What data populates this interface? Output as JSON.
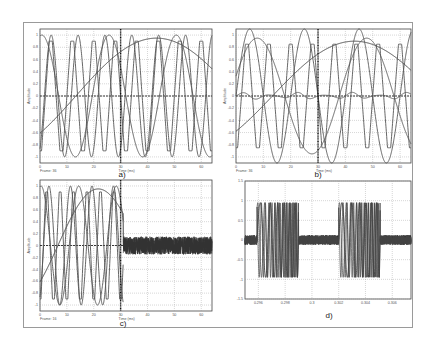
{
  "chart_data": [
    {
      "id": "a",
      "type": "line",
      "caption": "a)",
      "xlabel": "Time (ms)",
      "ylabel": "Amplitude",
      "frame_label": "Frame: 36",
      "xlim": [
        0,
        64
      ],
      "ylim": [
        -1.1,
        1.1
      ],
      "xticks": [
        "0",
        "10",
        "20",
        "30",
        "40",
        "50",
        "60"
      ],
      "yticks": [
        "1",
        "0.8",
        "0.6",
        "0.4",
        "0.2",
        "0",
        "-0.2",
        "-0.4",
        "-0.6",
        "-0.8",
        "-1"
      ],
      "cursor_x": 30,
      "grid": true,
      "series": [
        {
          "name": "slow sine",
          "kind": "sine",
          "amp": 0.95,
          "period_ms": 120,
          "phase_deg": -40
        },
        {
          "name": "medium sine",
          "kind": "sine",
          "amp": 1.0,
          "period_ms": 25,
          "phase_deg": 80
        },
        {
          "name": "fast sine",
          "kind": "sine",
          "amp": 1.0,
          "period_ms": 10,
          "phase_deg": -60
        },
        {
          "name": "triangle",
          "kind": "triangle",
          "amp": 0.9,
          "period_ms": 8,
          "phase_deg": 0
        }
      ]
    },
    {
      "id": "b",
      "type": "line",
      "caption": "b)",
      "xlabel": "Time (ms)",
      "ylabel": "Amplitude",
      "frame_label": "Frame: 36",
      "xlim": [
        0,
        64
      ],
      "ylim": [
        -1.1,
        1.1
      ],
      "xticks": [
        "0",
        "10",
        "20",
        "30",
        "40",
        "50",
        "60"
      ],
      "yticks": [
        "1",
        "0.8",
        "0.6",
        "0.4",
        "0.2",
        "0",
        "-0.2",
        "-0.4",
        "-0.6",
        "-0.8",
        "-1"
      ],
      "cursor_x": 30,
      "grid": true,
      "series": [
        {
          "name": "slow sine",
          "kind": "sine",
          "amp": 0.9,
          "period_ms": 120,
          "phase_deg": -40
        },
        {
          "name": "medium sine",
          "kind": "sine",
          "amp": 0.95,
          "period_ms": 40,
          "phase_deg": 20
        },
        {
          "name": "fast sine",
          "kind": "sine",
          "amp": 1.1,
          "period_ms": 20,
          "phase_deg": 0
        },
        {
          "name": "triangle",
          "kind": "triangle",
          "amp": 0.85,
          "period_ms": 8,
          "phase_deg": 0
        },
        {
          "name": "residual",
          "kind": "ripple",
          "amp": 0.06,
          "period_ms": 10,
          "phase_deg": 0
        }
      ]
    },
    {
      "id": "c",
      "type": "line",
      "caption": "c)",
      "xlabel": "Time (ms)",
      "ylabel": "Amplitude",
      "frame_label": "Frame: 16",
      "xlim": [
        0,
        64
      ],
      "ylim": [
        -1.1,
        1.1
      ],
      "xticks": [
        "0",
        "10",
        "20",
        "30",
        "40",
        "50",
        "60"
      ],
      "yticks": [
        "1",
        "0.8",
        "0.6",
        "0.4",
        "0.2",
        "0",
        "-0.2",
        "-0.4",
        "-0.6",
        "-0.8",
        "-1"
      ],
      "cursor_x": 30,
      "grid": true,
      "signal_end_ms": 31,
      "noise_amp_after": 0.15,
      "series": [
        {
          "name": "slow sine",
          "kind": "sine",
          "amp": 0.95,
          "period_ms": 60,
          "phase_deg": -40
        },
        {
          "name": "medium sine",
          "kind": "sine",
          "amp": 1.0,
          "period_ms": 14,
          "phase_deg": 80
        },
        {
          "name": "fast sine",
          "kind": "sine",
          "amp": 1.0,
          "period_ms": 8,
          "phase_deg": -60
        },
        {
          "name": "triangle",
          "kind": "triangle",
          "amp": 0.9,
          "period_ms": 5,
          "phase_deg": 0
        }
      ]
    },
    {
      "id": "d",
      "type": "line",
      "caption": "d)",
      "xlabel": "",
      "ylabel": "",
      "xlim": [
        0.295,
        0.3074
      ],
      "ylim": [
        -1.5,
        1.5
      ],
      "xticks": [
        "0.296",
        "0.298",
        "0.3",
        "0.302",
        "0.304",
        "0.306"
      ],
      "xtick_values": [
        0.296,
        0.298,
        0.3,
        0.302,
        0.304,
        0.306
      ],
      "yticks": [
        "1.5",
        "1",
        "0.5",
        "0",
        "-0.5",
        "-1",
        "-1.5"
      ],
      "grid": true,
      "bursts": [
        [
          0.2959,
          0.299
        ],
        [
          0.302,
          0.3051
        ]
      ],
      "noise_amp": 0.12,
      "burst_amp": 1.0
    }
  ]
}
